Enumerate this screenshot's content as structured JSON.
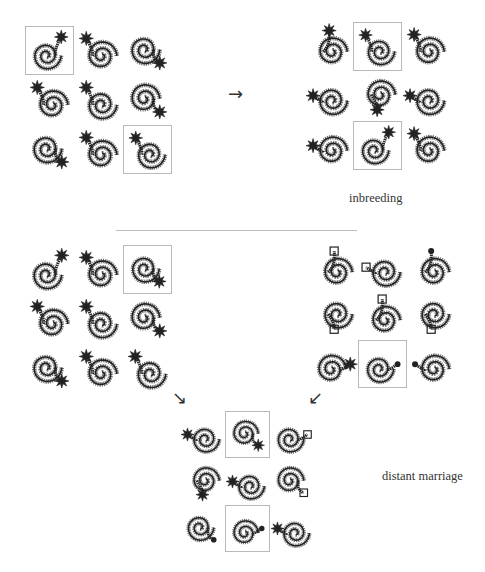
{
  "figure": {
    "arrows": {
      "right": "→",
      "down_right": "↘",
      "down_left": "↙"
    },
    "labels": {
      "inbreeding": "inbreeding",
      "distant_marriage": "distant marriage"
    },
    "colors": {
      "ink": "#222222",
      "light_ink": "#777777",
      "highlight_border": "#b9b9b9",
      "divider": "#bdbdbd"
    },
    "grids": [
      {
        "id": "parent-grid-top-left",
        "highlighted_cells": [
          0,
          8
        ],
        "cells": [
          {
            "shape": "j-hook-star-top-right"
          },
          {
            "shape": "spiral-star-top-left"
          },
          {
            "shape": "spiral-star-bottom-right"
          },
          {
            "shape": "spiral-star-bottom-right-small"
          },
          {
            "shape": "spiral-star-top-left"
          },
          {
            "shape": "curl-star-bottom-right"
          },
          {
            "shape": "hook-star-bottom-right"
          },
          {
            "shape": "spiral-star-top-left"
          },
          {
            "shape": "s-spiral-star-top-left"
          }
        ]
      },
      {
        "id": "offspring-grid-inbreeding",
        "highlighted_cells": [
          1,
          7
        ],
        "cells": [
          {
            "shape": "round-spiral-star-top"
          },
          {
            "shape": "s-spiral-star-top-left"
          },
          {
            "shape": "hook-star-top-left"
          },
          {
            "shape": "spiral-star-left"
          },
          {
            "shape": "loop-star-bottom"
          },
          {
            "shape": "curl-star-left"
          },
          {
            "shape": "curl-star-left"
          },
          {
            "shape": "j-hook-star-top-right"
          },
          {
            "shape": "hook-star-top-left"
          }
        ]
      },
      {
        "id": "parent-grid-middle-left",
        "highlighted_cells": [
          2
        ],
        "cells": [
          {
            "shape": "j-hook-star-top-right"
          },
          {
            "shape": "spiral-star-top-left"
          },
          {
            "shape": "spiral-star-bottom-right"
          },
          {
            "shape": "spiral-star-bottom-right-small"
          },
          {
            "shape": "spiral-star-top-left"
          },
          {
            "shape": "curl-star-bottom-right"
          },
          {
            "shape": "hook-star-bottom-right"
          },
          {
            "shape": "spiral-star-top-left"
          },
          {
            "shape": "s-spiral-star-top-left"
          }
        ]
      },
      {
        "id": "parent-grid-middle-right",
        "highlighted_cells": [
          7
        ],
        "cells": [
          {
            "shape": "paisley-crown-top"
          },
          {
            "shape": "eye-crown-left"
          },
          {
            "shape": "loop-bead-top"
          },
          {
            "shape": "curl-crown-bottom"
          },
          {
            "shape": "oval-crown-top"
          },
          {
            "shape": "oval-crown-bottom"
          },
          {
            "shape": "curl-star-right"
          },
          {
            "shape": "loop-bead-right"
          },
          {
            "shape": "arc-bead-bottom-left"
          }
        ]
      },
      {
        "id": "offspring-grid-distant-marriage",
        "highlighted_cells": [
          1,
          7
        ],
        "cells": [
          {
            "shape": "oval-star-bottom-left"
          },
          {
            "shape": "spiral-star-bottom-right"
          },
          {
            "shape": "spiral-crown-right"
          },
          {
            "shape": "double-loop-star-bottom"
          },
          {
            "shape": "oval-star-bottom-left"
          },
          {
            "shape": "curl-crown-bottom-right"
          },
          {
            "shape": "spiral-bead-bottom-right"
          },
          {
            "shape": "loop-bead-right"
          },
          {
            "shape": "eye-star-left"
          }
        ]
      }
    ]
  }
}
